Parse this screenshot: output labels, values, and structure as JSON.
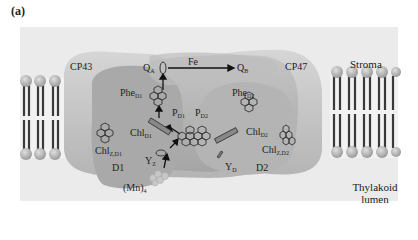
{
  "panel_label": "(a)",
  "regions": {
    "stroma": "Stroma",
    "lumen_line1": "Thylakoid",
    "lumen_line2": "lumen"
  },
  "subunits": {
    "cp43": "CP43",
    "cp47": "CP47",
    "d1": "D1",
    "d2": "D2"
  },
  "cofactors": {
    "qa": {
      "main": "Q",
      "sub": "A"
    },
    "qb": {
      "main": "Q",
      "sub": "B"
    },
    "fe": {
      "main": "Fe",
      "sub": ""
    },
    "phe_d1": {
      "main": "Phe",
      "sub": "D1"
    },
    "phe_d2": {
      "main": "Phe",
      "sub": "D2"
    },
    "p_d1": {
      "main": "P",
      "sub": "D1"
    },
    "p_d2": {
      "main": "P",
      "sub": "D2"
    },
    "chl_d1": {
      "main": "Chl",
      "sub": "D1"
    },
    "chl_d2": {
      "main": "Chl",
      "sub": "D2"
    },
    "chlz_d1": {
      "main": "Chl",
      "sub": "Z,D1"
    },
    "chlz_d2": {
      "main": "Chl",
      "sub": "Z,D2"
    },
    "yz": {
      "main": "Y",
      "sub": "Z"
    },
    "yd": {
      "main": "Y",
      "sub": "D"
    },
    "mn": {
      "main": "(Mn)",
      "sub": "4"
    }
  },
  "colors": {
    "background_box": "#ebebeb",
    "protein_light": "#c4c4c4",
    "protein_dark": "#a8a8a8",
    "lipid_head": "#b5b5b5",
    "lipid_tail": "#3a3a3a"
  }
}
